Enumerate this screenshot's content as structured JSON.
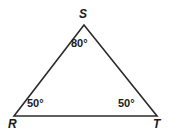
{
  "figure": {
    "type": "triangle-diagram",
    "shape_name": "triangle-RST",
    "stroke_color": "#2b2b2b",
    "background_color": "#ffffff",
    "vertices": [
      {
        "id": "S",
        "label": "S",
        "x": 84,
        "y": 25,
        "angle_label": "80°",
        "angle_value": 80
      },
      {
        "id": "R",
        "label": "R",
        "x": 14,
        "y": 116,
        "angle_label": "50°",
        "angle_value": 50
      },
      {
        "id": "T",
        "label": "T",
        "x": 157,
        "y": 116,
        "angle_label": "50°",
        "angle_value": 50
      }
    ]
  },
  "chart_data": {
    "type": "diagram",
    "title": "",
    "categories": [
      "S",
      "R",
      "T"
    ],
    "values": [
      80,
      50,
      50
    ],
    "labels": [
      "80°",
      "50°",
      "50°"
    ],
    "vertex_labels": [
      "S",
      "R",
      "T"
    ]
  }
}
